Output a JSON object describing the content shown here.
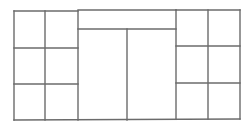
{
  "diagram": {
    "type": "floor-plan-grid",
    "background": "#ffffff",
    "line_color": "#6b6b6b",
    "line_width": 1.4,
    "outer_frame": {
      "left": 14,
      "top": 11,
      "right": 240,
      "bottom": 120
    },
    "left_block": {
      "x0": 14,
      "x1": 78,
      "col_split": 45,
      "row_splits": [
        48,
        84
      ],
      "top": 11,
      "bottom": 120
    },
    "center_block": {
      "x0": 78,
      "x1": 176,
      "top_bar_top": 10,
      "top_bar_bottom": 29,
      "col_split": 127,
      "bottom": 120
    },
    "right_block": {
      "x0": 176,
      "x1": 240,
      "col_split": 208,
      "row_splits": [
        46,
        83
      ],
      "top": 10,
      "bottom": 119
    }
  }
}
